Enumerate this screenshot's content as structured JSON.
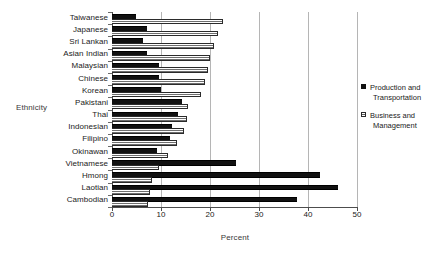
{
  "chart_data": {
    "type": "bar",
    "orientation": "horizontal",
    "title": "",
    "xlabel": "Percent",
    "ylabel": "Ethnicity",
    "xlim": [
      0,
      50
    ],
    "xticks": [
      0,
      10,
      20,
      30,
      40,
      50
    ],
    "grid": true,
    "legend_position": "right",
    "categories": [
      "Taiwanese",
      "Japanese",
      "Sri Lankan",
      "Asian Indian",
      "Malaysian",
      "Chinese",
      "Korean",
      "Pakistani",
      "Thai",
      "Indonesian",
      "Filipino",
      "Okinawan",
      "Vietnamese",
      "Hmong",
      "Laotian",
      "Cambodian"
    ],
    "series": [
      {
        "name": "Production and Transportation",
        "color": "#111111",
        "values": [
          4.8,
          7.2,
          6.4,
          7.1,
          9.6,
          9.5,
          10.0,
          14.2,
          13.5,
          12.3,
          11.9,
          9.1,
          25.4,
          42.5,
          46.2,
          37.7
        ]
      },
      {
        "name": "Business and Management",
        "color": "#6f6f6f",
        "values": [
          22.5,
          21.5,
          20.6,
          19.8,
          19.3,
          18.8,
          18.0,
          15.4,
          15.1,
          14.5,
          13.0,
          11.3,
          9.3,
          7.9,
          7.5,
          7.2
        ]
      }
    ]
  },
  "legend": {
    "entries": [
      {
        "line1": "Production and",
        "line2": "Transportation"
      },
      {
        "line1": "Business and",
        "line2": "Management"
      }
    ]
  }
}
